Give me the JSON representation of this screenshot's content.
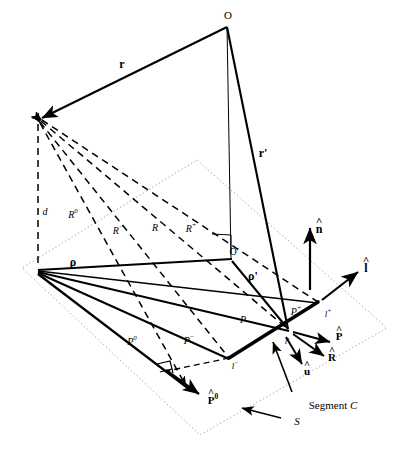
{
  "figure": {
    "type": "geometry-diagram",
    "width": 407,
    "height": 451,
    "background": "#ffffff",
    "stroke": "#000000",
    "dotted_plane_color": "#9a9a9a"
  },
  "labels": {
    "origin_O": "O",
    "origin_O_prime": "O'",
    "vector_r": "r",
    "vector_r_prime": "r'",
    "distance_d": "d",
    "R_zero": "R",
    "R_zero_sup": "0",
    "R_minus": "R",
    "R_minus_sup": "−",
    "R_plain": "R",
    "R_plus": "R",
    "R_plus_sup": "+",
    "rho": "ρ",
    "rho_prime": "ρ'",
    "P_zero": "P",
    "P_zero_sup": "0",
    "P_minus": "P",
    "P_minus_sup": "−",
    "P_plain": "P",
    "P_plus": "P",
    "P_plus_sup": "+",
    "l_minus": "l",
    "l_minus_sup": "−",
    "l_prime": "l'",
    "l_plus": "l",
    "l_plus_sup": "+",
    "unit_n": "n",
    "unit_l": "l",
    "unit_P": "P",
    "unit_P_zero": "P",
    "unit_P_zero_sup": "0",
    "unit_R": "R",
    "unit_u": "u",
    "segment_C": "Segment C",
    "surface_S": "S"
  },
  "points": {
    "O": {
      "x": 227,
      "y": 27
    },
    "field": {
      "x": 38,
      "y": 120
    },
    "hub": {
      "x": 38,
      "y": 270
    },
    "O_prime": {
      "x": 232,
      "y": 261
    },
    "l_prime": {
      "x": 289,
      "y": 330
    },
    "l_plus": {
      "x": 318,
      "y": 302
    },
    "l_minus": {
      "x": 229,
      "y": 358
    },
    "foot_P0": {
      "x": 186,
      "y": 386
    },
    "plane_top": {
      "x": 197,
      "y": 160
    },
    "plane_left": {
      "x": 22,
      "y": 268
    },
    "plane_bottom": {
      "x": 200,
      "y": 435
    },
    "plane_right": {
      "x": 387,
      "y": 328
    }
  },
  "arrows": {
    "n_hat": {
      "x1": 310,
      "y1": 290,
      "x2": 310,
      "y2": 228
    },
    "l_hat": {
      "x1": 322,
      "y1": 300,
      "x2": 358,
      "y2": 272
    },
    "P_hat": {
      "x1": 292,
      "y1": 333,
      "x2": 330,
      "y2": 343
    },
    "R_hat": {
      "x1": 292,
      "y1": 335,
      "x2": 324,
      "y2": 356
    },
    "u_hat": {
      "x1": 286,
      "y1": 336,
      "x2": 302,
      "y2": 364
    },
    "P0_hat": {
      "x1": 165,
      "y1": 369,
      "x2": 198,
      "y2": 393
    }
  },
  "annotations": {
    "segment_C_leader": {
      "x1": 292,
      "y1": 392,
      "x2": 272,
      "y2": 341
    },
    "surface_S_leader": {
      "x1": 280,
      "y1": 417,
      "x2": 243,
      "y2": 408
    }
  }
}
